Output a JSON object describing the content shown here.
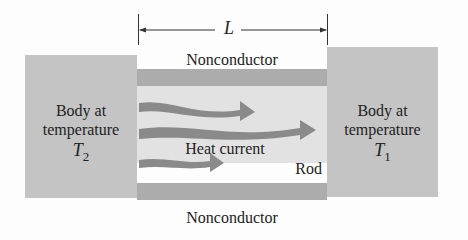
{
  "diagram": {
    "dimension": {
      "label": "L"
    },
    "left_body": {
      "line1": "Body at",
      "line2": "temperature",
      "symbol": "T",
      "subscript": "2"
    },
    "right_body": {
      "line1": "Body at",
      "line2": "temperature",
      "symbol": "T",
      "subscript": "1"
    },
    "top_insulator": "Nonconductor",
    "bottom_insulator": "Nonconductor",
    "flow_label": "Heat current",
    "rod_label": "Rod",
    "colors": {
      "body": "#c4c4c4",
      "nonconductor": "#acacac",
      "rod": "#e2e2e2",
      "arrow": "#8a8a8a",
      "background": "#fdfdfd"
    },
    "arrows": 3
  }
}
